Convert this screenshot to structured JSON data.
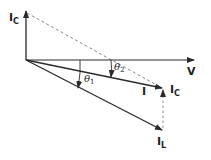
{
  "diagram": {
    "type": "phasor-diagram",
    "colors": {
      "line": "#2a2a2a",
      "dashed": "#8a8a8a",
      "background": "#ffffff"
    },
    "phasors": [
      {
        "id": "V",
        "label": "V",
        "subscript": "",
        "style": "solid"
      },
      {
        "id": "IC_vertical",
        "label": "I",
        "subscript": "C",
        "style": "solid"
      },
      {
        "id": "I",
        "label": "I",
        "subscript": "",
        "style": "solid"
      },
      {
        "id": "IL",
        "label": "I",
        "subscript": "L",
        "style": "solid"
      },
      {
        "id": "IC_shifted",
        "label": "I",
        "subscript": "C",
        "style": "dashed"
      }
    ],
    "angles": [
      {
        "id": "theta1",
        "symbol": "θ",
        "subscript": "1"
      },
      {
        "id": "theta2",
        "symbol": "θ",
        "subscript": "2"
      }
    ]
  }
}
